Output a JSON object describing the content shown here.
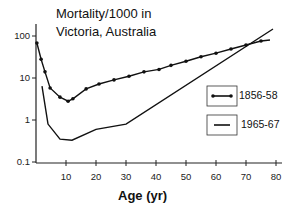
{
  "chart_data": {
    "type": "line",
    "title_lines": [
      "Mortality/1000 in",
      "Victoria, Australia"
    ],
    "xlabel": "Age (yr)",
    "ylabel": "",
    "yscale": "log",
    "xlim": [
      0,
      80
    ],
    "ylim": [
      0.1,
      100
    ],
    "grid": false,
    "legend_position": "right-middle",
    "x_ticks": [
      10,
      20,
      30,
      40,
      50,
      60,
      70,
      80
    ],
    "y_ticks": [
      0.1,
      1,
      10,
      100
    ],
    "y_tick_labels": [
      "0.1",
      "1",
      "10",
      "100"
    ],
    "x_tick_labels": [
      "10",
      "20",
      "30",
      "40",
      "50",
      "60",
      "70",
      "80"
    ],
    "series": [
      {
        "name": "1856-58",
        "marker": "dot",
        "x": [
          0.3,
          1.7,
          3,
          4.7,
          8,
          10.7,
          12.3,
          16.7,
          21,
          26,
          31,
          36,
          41,
          45,
          50,
          55,
          60,
          65,
          70,
          75,
          78
        ],
        "y": [
          68,
          28,
          14,
          5.8,
          3.5,
          2.8,
          3.2,
          5.5,
          7.2,
          9,
          11,
          14,
          16,
          20,
          25,
          32,
          39,
          49,
          61,
          76,
          80
        ]
      },
      {
        "name": "1965-67",
        "marker": "none",
        "x": [
          2,
          4,
          8,
          12,
          20,
          30,
          79
        ],
        "y": [
          6.4,
          0.8,
          0.35,
          0.33,
          0.6,
          0.8,
          147
        ]
      }
    ]
  }
}
